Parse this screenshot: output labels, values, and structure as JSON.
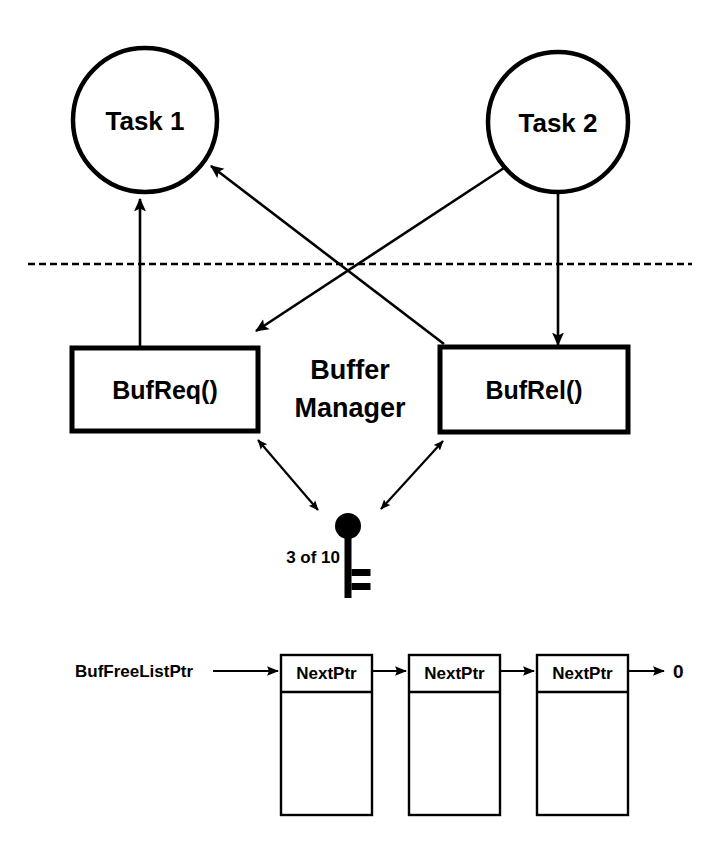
{
  "diagram": {
    "title": "Buffer Manager",
    "boundary_label": "",
    "tasks": [
      {
        "id": "task-1",
        "label": "Task 1",
        "cx": 145,
        "cy": 120,
        "r": 72
      },
      {
        "id": "task-2",
        "label": "Task 2",
        "cx": 558,
        "cy": 122,
        "r": 70
      }
    ],
    "functions": [
      {
        "id": "bufreq",
        "label": "BufReq()",
        "x": 72,
        "y": 348,
        "w": 186,
        "h": 83
      },
      {
        "id": "bufrel",
        "label": "BufRel()",
        "x": 440,
        "y": 347,
        "w": 188,
        "h": 85
      }
    ],
    "manager": {
      "line1": "Buffer",
      "line2": "Manager",
      "cx": 350,
      "y1": 379,
      "y2": 417
    },
    "semaphore": {
      "label": "3 of 10",
      "icon": "key-icon",
      "label_x": 340,
      "label_y": 563,
      "head_cx": 348,
      "head_cy": 526,
      "head_r": 13
    },
    "free_list": {
      "pointer_label": "BufFreeListPtr",
      "terminator_label": "0",
      "field_label": "NextPtr",
      "nodes": [
        {
          "id": "buf-node-1",
          "field": "NextPtr",
          "x": 281,
          "y": 655,
          "w": 91,
          "h": 160
        },
        {
          "id": "buf-node-2",
          "field": "NextPtr",
          "x": 409,
          "y": 655,
          "w": 91,
          "h": 160
        },
        {
          "id": "buf-node-3",
          "field": "NextPtr",
          "x": 537,
          "y": 655,
          "w": 91,
          "h": 160
        }
      ],
      "header_height": 37
    },
    "edges": [
      {
        "id": "edge-bufreq-to-task1",
        "from": "bufreq",
        "to": "task-1",
        "style": "single-arrow"
      },
      {
        "id": "edge-task2-to-bufrel",
        "from": "task-2",
        "to": "bufrel",
        "style": "single-arrow"
      },
      {
        "id": "edge-bufrel-to-task1",
        "from": "bufrel",
        "to": "task-1",
        "style": "single-arrow"
      },
      {
        "id": "edge-task2-to-bufreq",
        "from": "task-2",
        "to": "bufreq",
        "style": "single-arrow"
      },
      {
        "id": "edge-bufreq-semaphore",
        "from": "bufreq",
        "to": "semaphore",
        "style": "double-arrow"
      },
      {
        "id": "edge-bufrel-semaphore",
        "from": "bufrel",
        "to": "semaphore",
        "style": "double-arrow"
      },
      {
        "id": "edge-ptr-to-node1",
        "from": "BufFreeListPtr",
        "to": "buf-node-1",
        "style": "single-arrow"
      },
      {
        "id": "edge-node1-to-node2",
        "from": "buf-node-1",
        "to": "buf-node-2",
        "style": "single-arrow"
      },
      {
        "id": "edge-node2-to-node3",
        "from": "buf-node-2",
        "to": "buf-node-3",
        "style": "single-arrow"
      },
      {
        "id": "edge-node3-to-null",
        "from": "buf-node-3",
        "to": "0",
        "style": "single-arrow"
      }
    ],
    "colors": {
      "stroke": "#000000",
      "fill": "#ffffff"
    }
  }
}
